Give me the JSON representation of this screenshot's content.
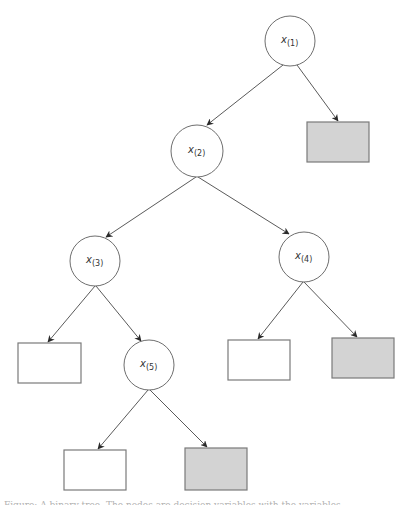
{
  "diagram": {
    "type": "binary-tree",
    "colors": {
      "stroke": "#6e6e6e",
      "edge": "#5a5a5a",
      "leaf_shaded": "#d3d3d3",
      "leaf_white": "#ffffff",
      "label": "#333333"
    },
    "nodes": [
      {
        "id": "x1",
        "var": "x",
        "sub": "(1)",
        "cx": 290,
        "cy": 41,
        "r": 25
      },
      {
        "id": "x2",
        "var": "x",
        "sub": "(2)",
        "cx": 197,
        "cy": 151,
        "r": 26
      },
      {
        "id": "x3",
        "var": "x",
        "sub": "(3)",
        "cx": 95,
        "cy": 261,
        "r": 25
      },
      {
        "id": "x4",
        "var": "x",
        "sub": "(4)",
        "cx": 304,
        "cy": 257,
        "r": 25
      },
      {
        "id": "x5",
        "var": "x",
        "sub": "(5)",
        "cx": 149,
        "cy": 365,
        "r": 25
      }
    ],
    "leaves": [
      {
        "id": "leaf-x1-right",
        "x": 307,
        "y": 122,
        "w": 62,
        "h": 40,
        "shaded": true
      },
      {
        "id": "leaf-x3-left",
        "x": 18,
        "y": 343,
        "w": 63,
        "h": 40,
        "shaded": false
      },
      {
        "id": "leaf-x4-left",
        "x": 228,
        "y": 340,
        "w": 62,
        "h": 40,
        "shaded": false
      },
      {
        "id": "leaf-x4-right",
        "x": 332,
        "y": 338,
        "w": 62,
        "h": 40,
        "shaded": true
      },
      {
        "id": "leaf-x5-left",
        "x": 64,
        "y": 450,
        "w": 62,
        "h": 40,
        "shaded": false
      },
      {
        "id": "leaf-x5-right",
        "x": 185,
        "y": 448,
        "w": 62,
        "h": 42,
        "shaded": true
      }
    ],
    "edges": [
      {
        "from": "x1",
        "to": "x2",
        "x1": 283,
        "y1": 65,
        "x2": 207,
        "y2": 125
      },
      {
        "from": "x1",
        "to": "leaf-x1-right",
        "x1": 297,
        "y1": 65,
        "x2": 338,
        "y2": 121
      },
      {
        "from": "x2",
        "to": "x3",
        "x1": 196,
        "y1": 177,
        "x2": 106,
        "y2": 237
      },
      {
        "from": "x2",
        "to": "x4",
        "x1": 198,
        "y1": 177,
        "x2": 289,
        "y2": 234
      },
      {
        "from": "x3",
        "to": "leaf-x3-left",
        "x1": 95,
        "y1": 286,
        "x2": 48,
        "y2": 342
      },
      {
        "from": "x3",
        "to": "x5",
        "x1": 96,
        "y1": 286,
        "x2": 141,
        "y2": 341
      },
      {
        "from": "x4",
        "to": "leaf-x4-left",
        "x1": 303,
        "y1": 282,
        "x2": 258,
        "y2": 339
      },
      {
        "from": "x4",
        "to": "leaf-x4-right",
        "x1": 304,
        "y1": 282,
        "x2": 357,
        "y2": 337
      },
      {
        "from": "x5",
        "to": "leaf-x5-left",
        "x1": 148,
        "y1": 390,
        "x2": 98,
        "y2": 449
      },
      {
        "from": "x5",
        "to": "leaf-x5-right",
        "x1": 150,
        "y1": 390,
        "x2": 207,
        "y2": 447
      }
    ]
  },
  "caption": {
    "text": "Figure: A binary tree. The nodes are decision variables with the variables ..."
  }
}
